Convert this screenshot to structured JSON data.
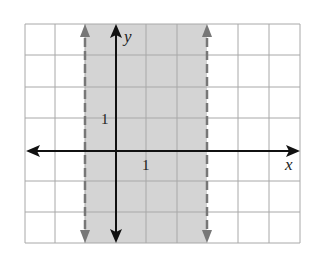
{
  "graph": {
    "type": "inequality-region",
    "description": "Shaded vertical strip between two dashed vertical lines",
    "x_axis_label": "x",
    "y_axis_label": "y",
    "x_tick_label": "1",
    "y_tick_label": "1",
    "grid": {
      "x_min": -3,
      "x_max": 6,
      "y_min": -3,
      "y_max": 4
    },
    "boundaries": [
      {
        "x": -1,
        "style": "dashed"
      },
      {
        "x": 3,
        "style": "dashed"
      }
    ],
    "shaded_region": {
      "from_x": -1,
      "to_x": 3
    },
    "colors": {
      "shade": "#d4d4d4",
      "grid": "#a8a8a8",
      "axis": "#111111",
      "boundary": "#777777"
    }
  }
}
